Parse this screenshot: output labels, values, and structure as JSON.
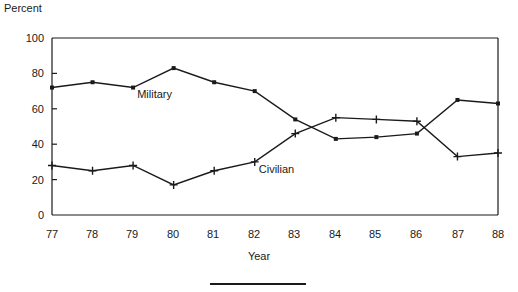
{
  "chart_data": {
    "type": "line",
    "title": "",
    "xlabel": "Year",
    "ylabel": "Percent",
    "categories": [
      "77",
      "78",
      "79",
      "80",
      "81",
      "82",
      "83",
      "84",
      "85",
      "86",
      "87",
      "88"
    ],
    "xlim": [
      77,
      88
    ],
    "ylim": [
      0,
      100
    ],
    "yticks": [
      0,
      20,
      40,
      60,
      80,
      100
    ],
    "grid": false,
    "legend": "inline-annotations",
    "series": [
      {
        "name": "Military",
        "marker": "square-dot",
        "values": [
          72,
          75,
          72,
          83,
          75,
          70,
          54,
          43,
          44,
          46,
          65,
          63
        ]
      },
      {
        "name": "Civilian",
        "marker": "plus",
        "values": [
          28,
          25,
          28,
          17,
          25,
          30,
          46,
          55,
          54,
          53,
          33,
          35
        ]
      }
    ],
    "annotations": [
      {
        "text": "Military",
        "x": 79.1,
        "y": 66
      },
      {
        "text": "Civilian",
        "x": 82.1,
        "y": 24
      }
    ]
  },
  "axes": {
    "ytick_labels": [
      "100",
      "80",
      "60",
      "40",
      "20",
      "0"
    ],
    "xtick_labels": [
      "77",
      "78",
      "79",
      "80",
      "81",
      "82",
      "83",
      "84",
      "85",
      "86",
      "87",
      "88"
    ],
    "ylabel_text": "Percent",
    "xlabel_text": "Year"
  }
}
